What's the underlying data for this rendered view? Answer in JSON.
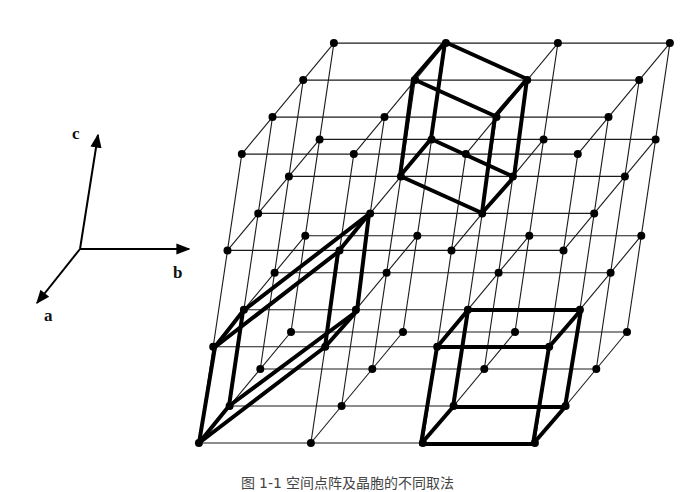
{
  "figure": {
    "colors": {
      "line": "#1a1a1a",
      "thick": "#000000",
      "dot": "#000000",
      "background": "#ffffff"
    },
    "axes": {
      "origin": [
        80,
        249
      ],
      "items": [
        {
          "name": "c",
          "label": "c",
          "tip": [
            98,
            135
          ],
          "label_pos": [
            72,
            139
          ]
        },
        {
          "name": "b",
          "label": "b",
          "tip": [
            189,
            249
          ],
          "label_pos": [
            173,
            278
          ]
        },
        {
          "name": "a",
          "label": "a",
          "tip": [
            37,
            303
          ],
          "label_pos": [
            44,
            321
          ]
        }
      ]
    },
    "lattice": {
      "origin": [
        291,
        332
      ],
      "a_step": [
        -30.7,
        37
      ],
      "b_step": [
        112,
        0
      ],
      "c_step": [
        14.3,
        -96.3
      ],
      "size": 4,
      "thin_width": 1.1,
      "dot_radius": 4
    },
    "cells": [
      {
        "name": "top-rotated-cell",
        "points": {
          "T1": [
            445,
            42
          ],
          "T2": [
            413,
            79
          ],
          "T3": [
            527,
            79
          ],
          "T4": [
            495,
            116
          ],
          "B1": [
            431,
            139
          ],
          "B2": [
            400,
            176
          ],
          "B3": [
            514,
            177
          ],
          "B4": [
            482,
            213
          ]
        },
        "edges": [
          [
            "T1",
            "T2"
          ],
          [
            "T1",
            "T3"
          ],
          [
            "T2",
            "T4"
          ],
          [
            "T3",
            "T4"
          ],
          [
            "B1",
            "B2"
          ],
          [
            "B1",
            "B3"
          ],
          [
            "B2",
            "B4"
          ],
          [
            "B3",
            "B4"
          ],
          [
            "T1",
            "B1"
          ],
          [
            "T2",
            "B2"
          ],
          [
            "T3",
            "B3"
          ],
          [
            "T4",
            "B4"
          ]
        ]
      },
      {
        "name": "left-oblique-cell",
        "points": {
          "P1": [
            199,
            443
          ],
          "P2": [
            229,
            406
          ],
          "P3": [
            325,
            347
          ],
          "P4": [
            357,
            311
          ],
          "P5": [
            215,
            347
          ],
          "P6": [
            243,
            311
          ],
          "P7": [
            338,
            252
          ],
          "P8": [
            369,
            214
          ]
        },
        "edges": [
          [
            "P1",
            "P2"
          ],
          [
            "P1",
            "P3"
          ],
          [
            "P2",
            "P4"
          ],
          [
            "P3",
            "P4"
          ],
          [
            "P5",
            "P6"
          ],
          [
            "P5",
            "P7"
          ],
          [
            "P6",
            "P8"
          ],
          [
            "P7",
            "P8"
          ],
          [
            "P1",
            "P5"
          ],
          [
            "P2",
            "P6"
          ],
          [
            "P3",
            "P7"
          ],
          [
            "P4",
            "P8"
          ]
        ]
      },
      {
        "name": "bottom-right-cubic-cell",
        "points": {
          "A": [
            421,
            444
          ],
          "B": [
            533,
            444
          ],
          "C": [
            565,
            407
          ],
          "D": [
            453,
            407
          ],
          "E": [
            437,
            347
          ],
          "F": [
            549,
            347
          ],
          "G": [
            581,
            310
          ],
          "H": [
            468,
            310
          ]
        },
        "edges": [
          [
            "A",
            "B"
          ],
          [
            "B",
            "C"
          ],
          [
            "C",
            "D"
          ],
          [
            "D",
            "A"
          ],
          [
            "E",
            "F"
          ],
          [
            "F",
            "G"
          ],
          [
            "G",
            "H"
          ],
          [
            "H",
            "E"
          ],
          [
            "A",
            "E"
          ],
          [
            "B",
            "F"
          ],
          [
            "C",
            "G"
          ],
          [
            "D",
            "H"
          ]
        ]
      }
    ],
    "thick_width": 4,
    "caption": "图 1-1 空间点阵及晶胞的不同取法"
  }
}
